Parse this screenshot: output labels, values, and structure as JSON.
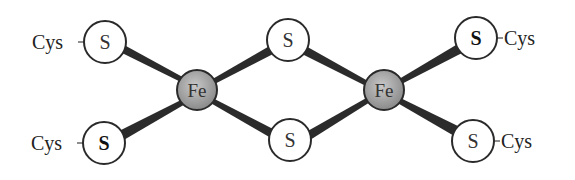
{
  "diagram": {
    "colors": {
      "bond": "#2b2b2b",
      "sulfur_fill": "#ffffff",
      "iron_fill": "#9a9a9a",
      "outline": "#2a2a2a"
    },
    "atoms": {
      "s_top_left": "S",
      "s_bottom_left": "S",
      "fe_left": "Fe",
      "s_bridge_top": "S",
      "s_bridge_bottom": "S",
      "fe_right": "Fe",
      "s_top_right": "S",
      "s_bottom_right": "S"
    },
    "ligands": {
      "top_left": "Cys",
      "bottom_left": "Cys",
      "top_right": "Cys",
      "bottom_right": "Cys"
    }
  }
}
